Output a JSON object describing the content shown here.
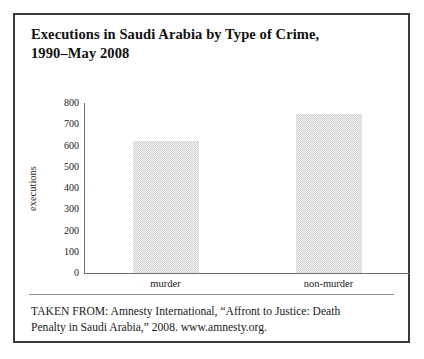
{
  "figure": {
    "title_line1": "Executions in Saudi Arabia by Type of Crime,",
    "title_line2": "1990–May 2008",
    "citation_line1": "TAKEN FROM: Amnesty International, “Affront to Justice: Death",
    "citation_line2": "Penalty in Saudi Arabia,” 2008. www.amnesty.org.",
    "frame_color": "#3a3a3a",
    "background_color": "#ffffff"
  },
  "chart_data": {
    "type": "bar",
    "title": "Executions in Saudi Arabia by Type of Crime, 1990–May 2008",
    "categories": [
      "murder",
      "non-murder"
    ],
    "values": [
      620,
      750
    ],
    "xlabel": "",
    "ylabel": "executions",
    "ylim": [
      0,
      800
    ],
    "ytick_values": [
      0,
      100,
      200,
      300,
      400,
      500,
      600,
      700,
      800
    ],
    "ytick_labels": [
      "0",
      "100",
      "200",
      "300",
      "400",
      "500",
      "600",
      "700",
      "800"
    ],
    "grid": false,
    "legend": false,
    "bar_fill_color": "#cccccc",
    "axis_color": "#6e6e6e",
    "source": "Amnesty International, “Affront to Justice: Death Penalty in Saudi Arabia,” 2008. www.amnesty.org."
  }
}
